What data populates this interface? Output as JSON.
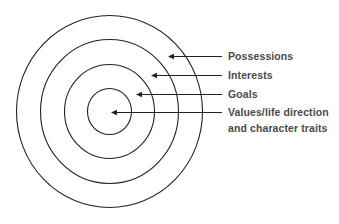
{
  "diagram": {
    "type": "concentric-circles",
    "colors": {
      "stroke": "#222222",
      "text": "#4a4a4a",
      "background": "#ffffff"
    },
    "center": {
      "x": 109.5,
      "y": 111.5
    },
    "rings": [
      {
        "name": "innermost",
        "rx": 22,
        "ry": 23
      },
      {
        "name": "third",
        "rx": 45,
        "ry": 47
      },
      {
        "name": "second",
        "rx": 69,
        "ry": 72
      },
      {
        "name": "outer",
        "rx": 93,
        "ry": 96
      }
    ],
    "labels": [
      {
        "text": "Possessions",
        "arrow_y": 56.5,
        "tip_x": 168
      },
      {
        "text": "Interests",
        "arrow_y": 75.5,
        "tip_x": 151
      },
      {
        "text": "Goals",
        "arrow_y": 94.5,
        "tip_x": 136
      },
      {
        "text": "Values/life direction",
        "text_line2": "and character traits",
        "arrow_y": 112.5,
        "tip_x": 111
      }
    ],
    "line_end_x": 222
  }
}
